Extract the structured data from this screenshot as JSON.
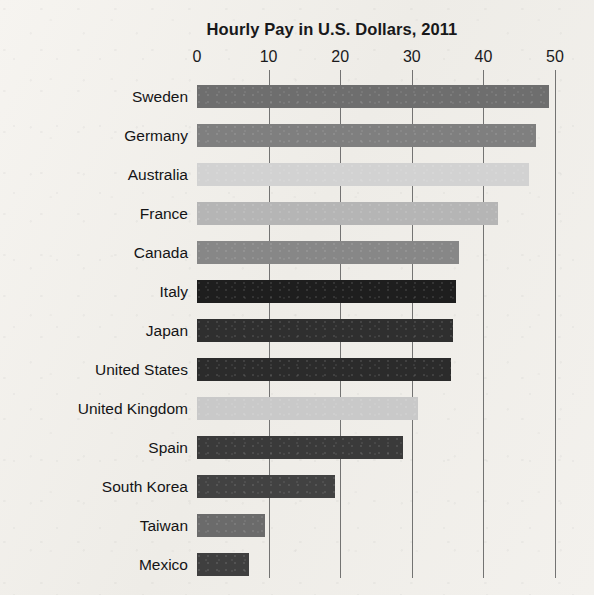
{
  "chart_data": {
    "type": "bar",
    "orientation": "horizontal",
    "title": "Hourly Pay in U.S. Dollars, 2011",
    "xlabel": "",
    "ylabel": "",
    "xlim": [
      0,
      50
    ],
    "xticks": [
      0,
      10,
      20,
      30,
      40,
      50
    ],
    "xtick_labels": [
      "0",
      "10",
      "20",
      "30",
      "40",
      "50"
    ],
    "grid": "vertical",
    "legend": "none",
    "categories": [
      "Sweden",
      "Germany",
      "Australia",
      "France",
      "Canada",
      "Italy",
      "Japan",
      "United States",
      "United Kingdom",
      "Spain",
      "South Korea",
      "Taiwan",
      "Mexico"
    ],
    "values": [
      49.1,
      47.4,
      46.3,
      42.1,
      36.6,
      36.2,
      35.7,
      35.5,
      30.8,
      28.8,
      19.3,
      9.5,
      7.2
    ],
    "bar_colors": [
      "#6e6e6e",
      "#7f7f7f",
      "#d2d2d2",
      "#b5b5b5",
      "#878787",
      "#1e1e1e",
      "#2f2f2f",
      "#2b2b2b",
      "#c9c9c9",
      "#3a3a3a",
      "#424242",
      "#6b6b6b",
      "#3f3f3f"
    ]
  },
  "page": {
    "background_color": "#f1efeb",
    "gridline_color": "#5d5d5d",
    "text_color": "#141416"
  }
}
